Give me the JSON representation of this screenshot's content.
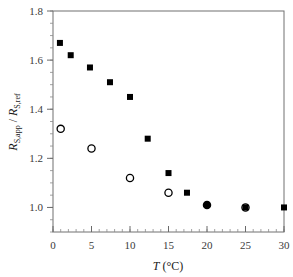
{
  "chart_data": {
    "type": "scatter",
    "title": "",
    "xlabel": "T (°C)",
    "xlabel_parts": {
      "italic": "T",
      "rest": " (°C)"
    },
    "ylabel": "R_S,app / R_S,ref",
    "ylabel_parts": {
      "r1": "R",
      "sub1": "S,app",
      "sep": " / ",
      "r2": "R",
      "sub2": "S,ref"
    },
    "xlim": [
      0,
      30
    ],
    "ylim": [
      0.9,
      1.8
    ],
    "xticks": [
      0,
      5,
      10,
      15,
      20,
      25,
      30
    ],
    "yticks": [
      1.0,
      1.2,
      1.4,
      1.6,
      1.8
    ],
    "xtick_labels": [
      "0",
      "5",
      "10",
      "15",
      "20",
      "25",
      "30"
    ],
    "ytick_labels": [
      "1.0",
      "1.2",
      "1.4",
      "1.6",
      "1.8"
    ],
    "grid": false,
    "legend": null,
    "series": [
      {
        "name": "filled squares",
        "marker": "square-filled",
        "color": "#000000",
        "x": [
          0.9,
          2.3,
          4.8,
          7.4,
          10.0,
          12.3,
          15.0,
          17.4,
          20.0,
          25.0,
          30.0
        ],
        "y": [
          1.67,
          1.62,
          1.57,
          1.51,
          1.45,
          1.28,
          1.14,
          1.06,
          1.01,
          1.0,
          1.0
        ]
      },
      {
        "name": "open circles",
        "marker": "circle-open",
        "color": "#000000",
        "x": [
          1.0,
          5.0,
          10.0,
          15.0,
          20.0,
          25.0
        ],
        "y": [
          1.32,
          1.24,
          1.12,
          1.06,
          1.01,
          1.0
        ]
      }
    ]
  }
}
